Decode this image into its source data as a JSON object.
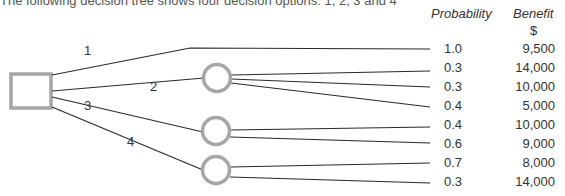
{
  "intro_text": "The following decision tree shows four decision options: 1, 2, 3 and 4",
  "headers": {
    "probability": "Probability",
    "benefit": "Benefit",
    "benefit_unit": "$"
  },
  "options": [
    {
      "label": "1",
      "outcomes": [
        {
          "probability": "1.0",
          "benefit": "9,500"
        }
      ]
    },
    {
      "label": "2",
      "outcomes": [
        {
          "probability": "0.3",
          "benefit": "14,000"
        },
        {
          "probability": "0.3",
          "benefit": "10,000"
        },
        {
          "probability": "0.4",
          "benefit": "5,000"
        }
      ]
    },
    {
      "label": "3",
      "outcomes": [
        {
          "probability": "0.4",
          "benefit": "10,000"
        },
        {
          "probability": "0.6",
          "benefit": "9,000"
        }
      ]
    },
    {
      "label": "4",
      "outcomes": [
        {
          "probability": "0.7",
          "benefit": "8,000"
        },
        {
          "probability": "0.3",
          "benefit": "14,000"
        }
      ]
    }
  ],
  "rows": [
    {
      "probability": "1.0",
      "benefit": "9,500"
    },
    {
      "probability": "0.3",
      "benefit": "14,000"
    },
    {
      "probability": "0.3",
      "benefit": "10,000"
    },
    {
      "probability": "0.4",
      "benefit": "5,000"
    },
    {
      "probability": "0.4",
      "benefit": "10,000"
    },
    {
      "probability": "0.6",
      "benefit": "9,000"
    },
    {
      "probability": "0.7",
      "benefit": "8,000"
    },
    {
      "probability": "0.3",
      "benefit": "14,000"
    }
  ],
  "colors": {
    "node_stroke": "#a6a6a6",
    "line": "#2a2a2a"
  }
}
